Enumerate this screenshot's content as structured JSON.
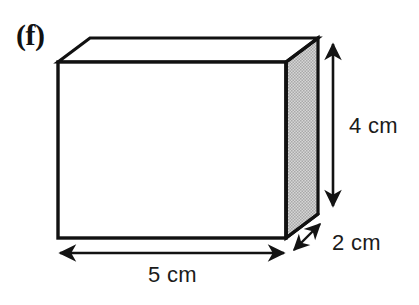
{
  "figure": {
    "part_label": "(f)",
    "shape_name": "rectangular-prism",
    "caption_alt": "Rectangular prism with labelled dimensions"
  },
  "dimensions": {
    "width": {
      "value": 5,
      "unit": "cm",
      "label": "5 cm",
      "edge": "front-bottom-horizontal"
    },
    "height": {
      "value": 4,
      "unit": "cm",
      "label": "4 cm",
      "edge": "right-vertical"
    },
    "depth": {
      "value": 2,
      "unit": "cm",
      "label": "2 cm",
      "edge": "bottom-right-diagonal"
    }
  },
  "colors": {
    "stroke": "#111111",
    "front_face": "#ffffff",
    "top_face": "#ffffff",
    "side_face": "#c9c9c9",
    "background": "#ffffff",
    "arrow": "#1a1a1a",
    "text": "#1b1b1b"
  },
  "geometry": {
    "front": {
      "x1": 58,
      "y1": 62,
      "x2": 286,
      "y2": 238
    },
    "depth_offset": {
      "dx": 32,
      "dy": -24
    },
    "stroke_width": 3.2
  },
  "arrows": {
    "height_arrow": {
      "name": "height-dimension-arrow",
      "x": 333,
      "y1": 42,
      "y2": 208,
      "heads": "both"
    },
    "width_arrow": {
      "name": "width-dimension-arrow",
      "y": 253,
      "x1": 57,
      "x2": 287,
      "heads": "both"
    },
    "depth_arrow": {
      "name": "depth-dimension-arrow",
      "x1": 292,
      "y1": 252,
      "x2": 322,
      "y2": 222,
      "heads": "both"
    }
  }
}
